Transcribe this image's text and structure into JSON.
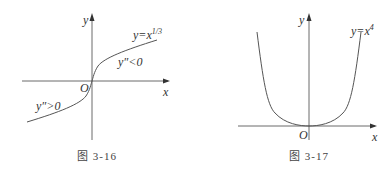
{
  "figures": [
    {
      "caption": "图 3-16",
      "function_label": "y=x",
      "function_exponent": "1/3",
      "region_labels": [
        "y″<0",
        "y″>0"
      ],
      "axis_x": "x",
      "axis_y": "y",
      "origin": "O"
    },
    {
      "caption": "图 3-17",
      "function_label": "y=x",
      "function_exponent": "4",
      "axis_x": "x",
      "axis_y": "y",
      "origin": "O"
    }
  ]
}
